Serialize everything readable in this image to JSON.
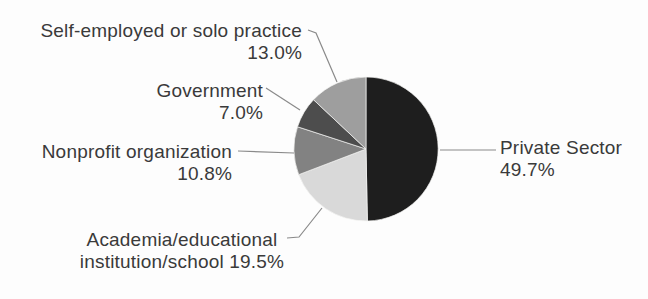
{
  "chart_data": {
    "type": "pie",
    "title": "",
    "direction": "clockwise",
    "start_angle_deg": 0,
    "legend_position": "callout-labels",
    "slices": [
      {
        "label": "Private Sector",
        "value": 49.7,
        "display": "49.7%",
        "color": "#1e1e1e"
      },
      {
        "label": "Academia/educational institution/school",
        "value": 19.5,
        "display": "19.5%",
        "color": "#d9d9d9"
      },
      {
        "label": "Nonprofit organization",
        "value": 10.8,
        "display": "10.8%",
        "color": "#828282"
      },
      {
        "label": "Government",
        "value": 7.0,
        "display": "7.0%",
        "color": "#4d4d4d"
      },
      {
        "label": "Self-employed or solo practice",
        "value": 13.0,
        "display": "13.0%",
        "color": "#9e9e9e"
      }
    ]
  },
  "callouts": {
    "self_employed": {
      "line1": "Self-employed or solo practice",
      "line2": "13.0%"
    },
    "government": {
      "line1": "Government",
      "line2": "7.0%"
    },
    "nonprofit": {
      "line1": "Nonprofit organization",
      "line2": "10.8%"
    },
    "academia": {
      "line1": "Academia/educational",
      "line2": "institution/school 19.5%"
    },
    "private": {
      "line1": "Private Sector",
      "line2": "49.7%"
    }
  },
  "colors": {
    "text": "#3a3a3a",
    "leader_line": "#8a8a8a",
    "background": "#fdfdfd",
    "slice_seam": "#f4f4f2"
  }
}
